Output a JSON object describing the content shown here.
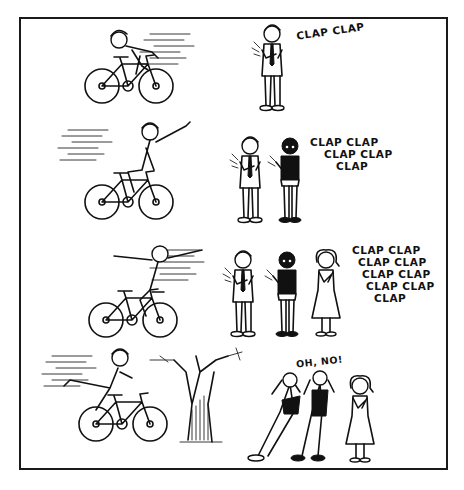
{
  "comic": {
    "panels": [
      {
        "row": 1,
        "rider_pose": "hunched-forward-racing",
        "audience_count": 1,
        "speech": [
          "CLAP CLAP"
        ]
      },
      {
        "row": 2,
        "rider_pose": "waving-one-hand",
        "audience_count": 2,
        "speech": [
          "CLAP CLAP",
          "CLAP CLAP",
          "CLAP"
        ]
      },
      {
        "row": 3,
        "rider_pose": "no-hands-arms-outstretched",
        "audience_count": 3,
        "speech": [
          "CLAP CLAP",
          "CLAP CLAP",
          "CLAP CLAP",
          "CLAP CLAP",
          "CLAP"
        ]
      },
      {
        "row": 4,
        "rider_pose": "crashing-into-tree",
        "audience_count": 3,
        "speech": [
          "OH, NO!"
        ]
      }
    ],
    "colors": {
      "ink": "#111111",
      "paper": "#ffffff",
      "border": "#1a1a1a"
    }
  }
}
